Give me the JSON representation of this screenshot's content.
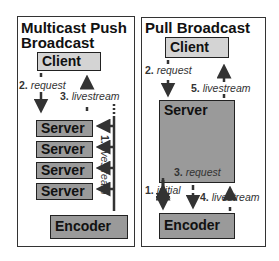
{
  "left_panel": {
    "title_line1": "Multicast Push",
    "title_line2": "Broadcast",
    "client": "Client",
    "servers": [
      "Server",
      "Server",
      "Server",
      "Server"
    ],
    "encoder": "Encoder",
    "labels": {
      "request_num": "2.",
      "request": "request",
      "livestream_num": "3.",
      "livestream": "livestream",
      "multicast_num": "1.",
      "multicast": "livestream"
    }
  },
  "right_panel": {
    "title": "Pull Broadcast",
    "client": "Client",
    "server": "Server",
    "encoder": "Encoder",
    "labels": {
      "request_num": "2.",
      "request": "request",
      "livestream_num": "5.",
      "livestream": "livestream",
      "req3_num": "3.",
      "req3": "request",
      "initial_num": "1.",
      "initial": "initial",
      "live4_num": "4.",
      "live4": "livestream"
    }
  },
  "colors": {
    "light_box": "#d4d4d4",
    "dark_box": "#9a9a9a",
    "arrow": "#333333"
  }
}
